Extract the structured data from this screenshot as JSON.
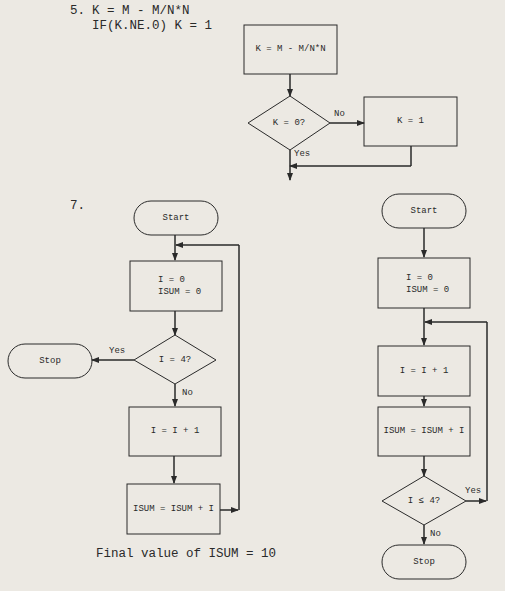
{
  "problem5": {
    "number": "5.",
    "code_line1": "K = M - M/N*N",
    "code_line2": "IF(K.NE.0) K = 1",
    "flowchart": {
      "process1": "K = M - M/N*N",
      "decision": "K = 0?",
      "no_label": "No",
      "yes_label": "Yes",
      "process2": "K = 1"
    }
  },
  "problem7": {
    "number": "7.",
    "left_flowchart": {
      "start": "Start",
      "init_line1": "I = 0",
      "init_line2": "ISUM = 0",
      "decision": "I = 4?",
      "yes_label": "Yes",
      "stop": "Stop",
      "no_label": "No",
      "increment": "I = I + 1",
      "accumulate": "ISUM = ISUM + I"
    },
    "final_value": "Final value of ISUM = 10",
    "right_flowchart": {
      "start": "Start",
      "init_line1": "I = 0",
      "init_line2": "ISUM = 0",
      "increment": "I = I + 1",
      "accumulate": "ISUM = ISUM + I",
      "decision": "I ≤ 4?",
      "yes_label": "Yes",
      "no_label": "No",
      "stop": "Stop"
    }
  }
}
